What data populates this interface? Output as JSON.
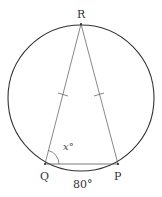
{
  "figure": {
    "circle": {
      "cx": 81,
      "cy": 98,
      "r": 73,
      "stroke": "#333333"
    },
    "points": [
      {
        "name": "R",
        "x": 81,
        "y": 24,
        "label": "R"
      },
      {
        "name": "Q",
        "x": 45,
        "y": 164,
        "label": "Q"
      },
      {
        "name": "P",
        "x": 118,
        "y": 164,
        "label": "P"
      }
    ],
    "angle_label": "x°",
    "arc_label": "80°",
    "segments": [
      "RQ",
      "RP",
      "QP"
    ],
    "equal_marks": [
      "RQ",
      "RP"
    ]
  }
}
